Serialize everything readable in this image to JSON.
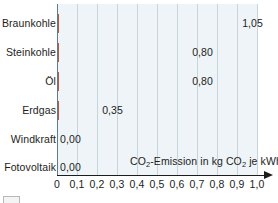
{
  "chart_data": {
    "type": "bar",
    "orientation": "horizontal",
    "title": "",
    "xlabel": "CO2-Emission in kg CO2 je kWh",
    "xlabel_parts": {
      "p1": "CO",
      "sub1": "2",
      "p2": "-Emission in kg CO",
      "sub2": "2",
      "p3": " je kWh"
    },
    "ylabel": "",
    "categories": [
      "Braunkohle",
      "Steinkohle",
      "Öl",
      "Erdgas",
      "Windkraft",
      "Fotovoltaik"
    ],
    "values": [
      1.05,
      0.8,
      0.8,
      0.35,
      0.0,
      0.0
    ],
    "value_labels": [
      "1,05",
      "0,80",
      "0,80",
      "0,35",
      "0,00",
      "0,00"
    ],
    "xlim": [
      0,
      1.05
    ],
    "xticks": [
      0,
      0.1,
      0.2,
      0.3,
      0.4,
      0.5,
      0.6,
      0.7,
      0.8,
      0.9,
      1.0
    ],
    "xtick_labels": [
      "0",
      "0,1",
      "0,2",
      "0,3",
      "0,4",
      "0,5",
      "0,6",
      "0,7",
      "0,8",
      "0,9",
      "1,0"
    ],
    "grid": "vertical",
    "legend": "none",
    "colors": {
      "bar_fill": "#ef8f6b",
      "bar_stroke": "#c4543a",
      "plot_background": "#eef4f7",
      "gridline": "#c9d4da",
      "axis": "#1d1d1b",
      "text": "#1d1d1b"
    }
  },
  "bars": [
    {
      "label": "Braunkohle",
      "value_label": "1,05",
      "value": 1.05
    },
    {
      "label": "Steinkohle",
      "value_label": "0,80",
      "value": 0.8
    },
    {
      "label": "Öl",
      "value_label": "0,80",
      "value": 0.8
    },
    {
      "label": "Erdgas",
      "value_label": "0,35",
      "value": 0.35
    },
    {
      "label": "Windkraft",
      "value_label": "0,00",
      "value": 0
    },
    {
      "label": "Fotovoltaik",
      "value_label": "0,00",
      "value": 0
    }
  ]
}
